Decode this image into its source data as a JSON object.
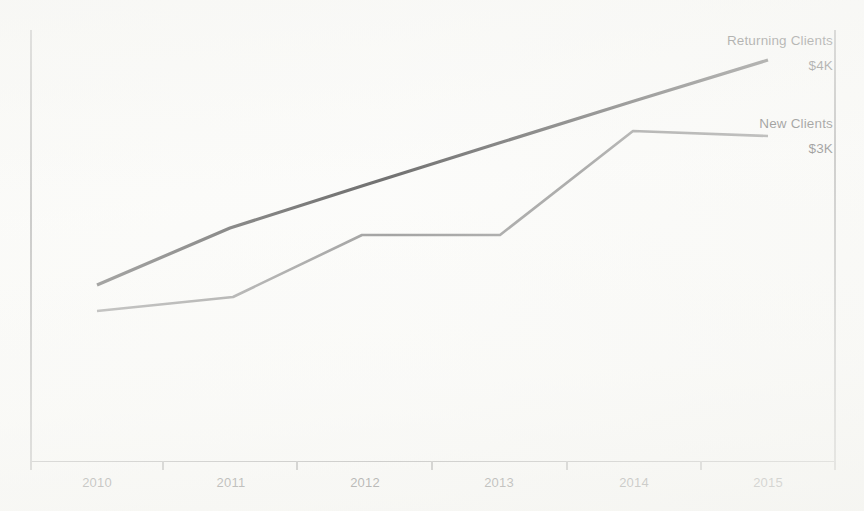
{
  "chart_data": {
    "type": "line",
    "title": "",
    "subtitle": "",
    "xlabel": "",
    "ylabel": "",
    "grid": false,
    "legend_position": "inline-right-end-of-line",
    "categories": [
      "2010",
      "2011",
      "2012",
      "2013",
      "2014",
      "2015"
    ],
    "xlim": [
      2010,
      2015
    ],
    "ylim": [
      0,
      5
    ],
    "y_unit": "$K",
    "series": [
      {
        "name": "Returning Clients",
        "end_label": "$4K",
        "color": "#2b2b2b",
        "values": [
          2.0,
          2.6,
          3.1,
          3.4,
          3.75,
          4.0
        ],
        "pixel_points": [
          [
            97,
            285
          ],
          [
            230,
            228
          ],
          [
            365,
            185
          ],
          [
            499,
            143
          ],
          [
            634,
            101
          ],
          [
            768,
            60
          ]
        ]
      },
      {
        "name": "New Clients",
        "end_label": "$3K",
        "color": "#6f6f6f",
        "values": [
          1.75,
          1.9,
          2.45,
          2.45,
          3.05,
          3.0
        ],
        "pixel_points": [
          [
            97,
            311
          ],
          [
            233,
            297
          ],
          [
            362,
            235
          ],
          [
            500,
            235
          ],
          [
            633,
            131
          ],
          [
            768,
            136
          ]
        ]
      }
    ],
    "annotations": [
      {
        "text": "Returning Clients",
        "x": 833,
        "y": 45
      },
      {
        "text": "$4K",
        "x": 833,
        "y": 70
      },
      {
        "text": "New Clients",
        "x": 833,
        "y": 128
      },
      {
        "text": "$3K",
        "x": 833,
        "y": 153
      }
    ],
    "axis_ticks_x_px": [
      31,
      163,
      297,
      432,
      567,
      701,
      835
    ],
    "tick_label_x_px": [
      97,
      231,
      365,
      499,
      634,
      768
    ]
  },
  "axes": {
    "left_axis_name": "y-axis-left",
    "right_axis_name": "y-axis-right",
    "bottom_axis_name": "x-axis"
  }
}
